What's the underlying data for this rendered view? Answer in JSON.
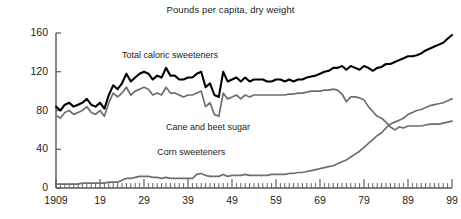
{
  "chart_data": {
    "type": "line",
    "title": "Pounds per capita, dry weight",
    "xlabel": "",
    "ylabel": "",
    "xlim": [
      1909,
      1999
    ],
    "ylim": [
      0,
      160
    ],
    "yticks": [
      0,
      40,
      80,
      120,
      160
    ],
    "ytick_labels": [
      "0",
      "40",
      "80",
      "120",
      "160"
    ],
    "xticks": [
      1909,
      1919,
      1929,
      1939,
      1949,
      1959,
      1969,
      1979,
      1989,
      1999
    ],
    "xtick_labels": [
      "1909",
      "19",
      "29",
      "39",
      "49",
      "59",
      "69",
      "79",
      "89",
      "99"
    ],
    "minor_tick_interval": 1,
    "grid": false,
    "legend": "inline-labels",
    "colors": {
      "total_caloric_sweeteners": "#000000",
      "cane_and_beet_sugar": "#6e6e6e",
      "corn_sweeteners": "#6e6e6e",
      "axis": "#555555",
      "text": "#222222",
      "background": "#ffffff"
    },
    "x": [
      1909,
      1910,
      1911,
      1912,
      1913,
      1914,
      1915,
      1916,
      1917,
      1918,
      1919,
      1920,
      1921,
      1922,
      1923,
      1924,
      1925,
      1926,
      1927,
      1928,
      1929,
      1930,
      1931,
      1932,
      1933,
      1934,
      1935,
      1936,
      1937,
      1938,
      1939,
      1940,
      1941,
      1942,
      1943,
      1944,
      1945,
      1946,
      1947,
      1948,
      1949,
      1950,
      1951,
      1952,
      1953,
      1954,
      1955,
      1956,
      1957,
      1958,
      1959,
      1960,
      1961,
      1962,
      1963,
      1964,
      1965,
      1966,
      1967,
      1968,
      1969,
      1970,
      1971,
      1972,
      1973,
      1974,
      1975,
      1976,
      1977,
      1978,
      1979,
      1980,
      1981,
      1982,
      1983,
      1984,
      1985,
      1986,
      1987,
      1988,
      1989,
      1990,
      1991,
      1992,
      1993,
      1994,
      1995,
      1996,
      1997,
      1998,
      1999
    ],
    "series": [
      {
        "name": "Total caloric sweeteners",
        "color": "#000000",
        "label_position": {
          "x": 1924,
          "y": 136
        },
        "values": [
          84,
          80,
          86,
          88,
          84,
          86,
          88,
          92,
          86,
          84,
          88,
          82,
          96,
          106,
          102,
          108,
          118,
          110,
          114,
          118,
          120,
          118,
          112,
          116,
          114,
          124,
          116,
          116,
          112,
          112,
          114,
          114,
          118,
          120,
          104,
          108,
          96,
          94,
          120,
          110,
          112,
          114,
          110,
          114,
          110,
          112,
          112,
          112,
          110,
          110,
          112,
          112,
          110,
          112,
          110,
          112,
          112,
          114,
          115,
          116,
          118,
          120,
          121,
          124,
          124,
          126,
          122,
          126,
          124,
          122,
          126,
          124,
          121,
          124,
          125,
          128,
          128,
          130,
          132,
          134,
          136,
          136,
          137,
          139,
          142,
          144,
          146,
          148,
          150,
          154,
          158
        ]
      },
      {
        "name": "Cane and beet sugar",
        "color": "#6e6e6e",
        "label_position": {
          "x": 1934,
          "y": 62
        },
        "values": [
          75,
          72,
          78,
          80,
          76,
          78,
          80,
          84,
          78,
          76,
          80,
          74,
          88,
          98,
          94,
          98,
          104,
          96,
          100,
          102,
          104,
          102,
          96,
          98,
          96,
          104,
          98,
          98,
          96,
          94,
          96,
          96,
          98,
          100,
          84,
          88,
          76,
          74,
          98,
          92,
          94,
          96,
          92,
          96,
          94,
          96,
          96,
          96,
          96,
          96,
          96,
          96,
          96,
          97,
          97,
          98,
          98,
          99,
          100,
          100,
          100,
          101,
          101,
          102,
          101,
          97,
          89,
          94,
          94,
          93,
          91,
          84,
          79,
          74,
          72,
          68,
          63,
          60,
          63,
          62,
          64,
          64,
          64,
          64,
          65,
          66,
          66,
          66,
          67,
          68,
          69
        ]
      },
      {
        "name": "Corn sweeteners",
        "color": "#6e6e6e",
        "label_position": {
          "x": 1932,
          "y": 36
        },
        "values": [
          4,
          4,
          4,
          4,
          4,
          4,
          5,
          5,
          5,
          5,
          5,
          5,
          6,
          6,
          6,
          8,
          10,
          10,
          11,
          12,
          12,
          12,
          11,
          11,
          10,
          11,
          10,
          10,
          10,
          10,
          10,
          10,
          14,
          15,
          13,
          12,
          12,
          12,
          14,
          12,
          13,
          13,
          13,
          14,
          13,
          13,
          13,
          13,
          13,
          14,
          14,
          14,
          14,
          15,
          15,
          16,
          16,
          17,
          18,
          19,
          20,
          21,
          22,
          23,
          25,
          27,
          29,
          32,
          35,
          38,
          42,
          46,
          50,
          54,
          57,
          62,
          66,
          68,
          70,
          72,
          76,
          78,
          80,
          81,
          83,
          85,
          86,
          87,
          88,
          90,
          92
        ]
      }
    ]
  }
}
